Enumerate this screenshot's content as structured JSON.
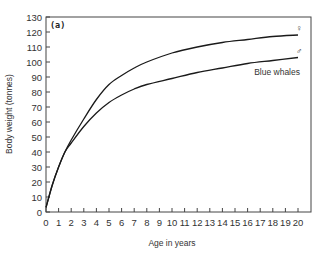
{
  "chart_data": {
    "type": "line",
    "title": "",
    "panel_label": "(a)",
    "xlabel": "Age in years",
    "ylabel": "Body weight  (tonnes)",
    "xlim": [
      0,
      20
    ],
    "ylim": [
      0,
      130
    ],
    "xticks": [
      0,
      1,
      2,
      3,
      4,
      5,
      6,
      7,
      8,
      9,
      10,
      11,
      12,
      13,
      14,
      15,
      16,
      17,
      18,
      19,
      20
    ],
    "yticks": [
      0,
      10,
      20,
      30,
      40,
      50,
      60,
      70,
      80,
      90,
      100,
      110,
      120,
      130
    ],
    "grid": false,
    "legend": "inline labels at right end of curves",
    "annotation": "Blue whales",
    "x": [
      0,
      0.5,
      1,
      1.5,
      2,
      3,
      4,
      5,
      6,
      7,
      8,
      10,
      12,
      14,
      16,
      18,
      20
    ],
    "series": [
      {
        "name": "Female",
        "symbol": "♀",
        "values": [
          3,
          18,
          30,
          40,
          48,
          62,
          75,
          85,
          91,
          96,
          100,
          106,
          110,
          113,
          115,
          117,
          118
        ]
      },
      {
        "name": "Male",
        "symbol": "♂",
        "values": [
          3,
          18,
          30,
          40,
          46,
          57,
          66,
          73,
          78,
          82,
          85,
          89,
          93,
          96,
          99,
          101,
          103
        ]
      }
    ]
  }
}
